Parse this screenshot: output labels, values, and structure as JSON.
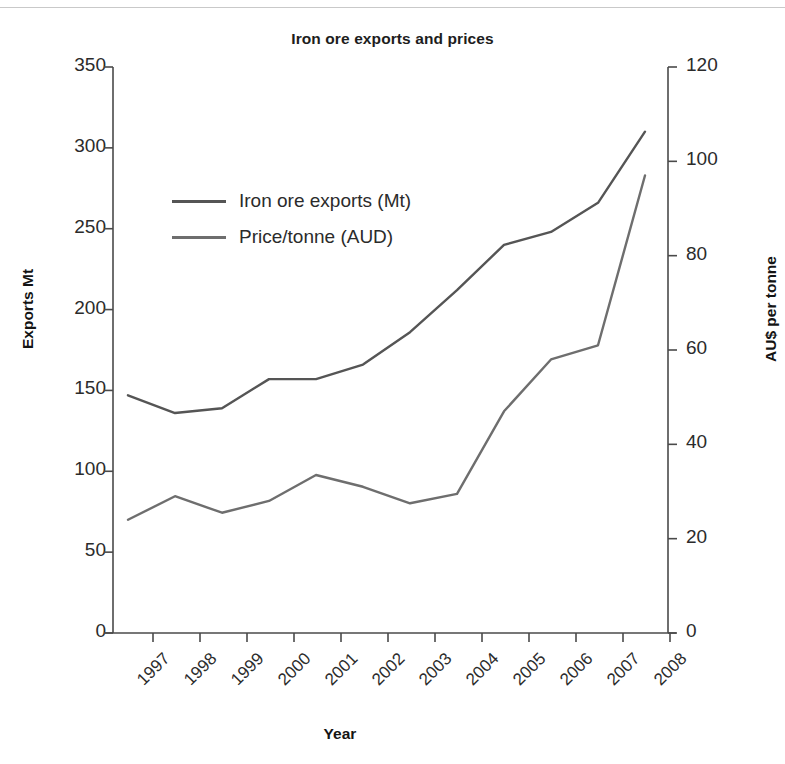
{
  "chart_data": {
    "type": "line",
    "title": "Iron ore exports and prices",
    "xlabel": "Year",
    "ylabel": "Exports Mt",
    "ylabel_right": "AU$ per tonne",
    "categories": [
      "1997",
      "1998",
      "1999",
      "2000",
      "2001",
      "2002",
      "2003",
      "2004",
      "2005",
      "2006",
      "2007",
      "2008"
    ],
    "ylim": [
      0,
      350
    ],
    "yticks": [
      0,
      50,
      100,
      150,
      200,
      250,
      300,
      350
    ],
    "ylim_right": [
      0,
      120
    ],
    "yticks_right": [
      0,
      20,
      40,
      60,
      80,
      100,
      120
    ],
    "grid": false,
    "legend_position": "upper left inside",
    "series": [
      {
        "name": "Iron ore exports (Mt)",
        "axis": "left",
        "color": "#555555",
        "values": [
          147,
          136,
          139,
          157,
          157,
          166,
          186,
          212,
          240,
          248,
          266,
          310
        ]
      },
      {
        "name": "Price/tonne (AUD)",
        "axis": "right",
        "color": "#6e6e6e",
        "values": [
          24,
          29,
          25.5,
          28,
          33.5,
          31,
          27.5,
          29.5,
          47,
          58,
          61,
          97
        ]
      }
    ]
  },
  "axes": {
    "left_tick_labels": [
      "350",
      "300",
      "250",
      "200",
      "150",
      "100",
      "50",
      "0"
    ],
    "right_tick_labels": [
      "120",
      "100",
      "80",
      "60",
      "40",
      "20",
      "0"
    ]
  },
  "colors": {
    "axis": "#4a4a4a",
    "text": "#2b2b2b",
    "title": "#1d1d1d",
    "exports_line": "#555555",
    "price_line": "#6e6e6e",
    "background": "#ffffff",
    "top_rule": "#c9c9c9"
  }
}
